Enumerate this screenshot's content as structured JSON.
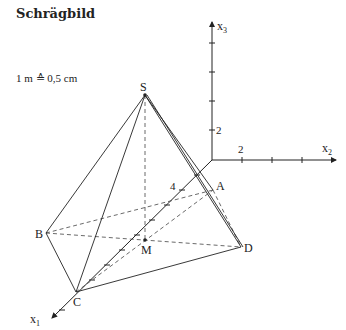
{
  "title": "Schrägbild",
  "scale_note": "1 m ≙ 0,5 cm",
  "axes": {
    "x1": {
      "label": "x",
      "sub": "1",
      "tick_label": "4"
    },
    "x2": {
      "label": "x",
      "sub": "2",
      "tick_label": "2"
    },
    "x3": {
      "label": "x",
      "sub": "3",
      "tick_label": "2"
    }
  },
  "points": {
    "S": "S",
    "A": "A",
    "B": "B",
    "C": "C",
    "D": "D",
    "M": "M"
  },
  "colors": {
    "line": "#222222",
    "background": "#ffffff"
  }
}
